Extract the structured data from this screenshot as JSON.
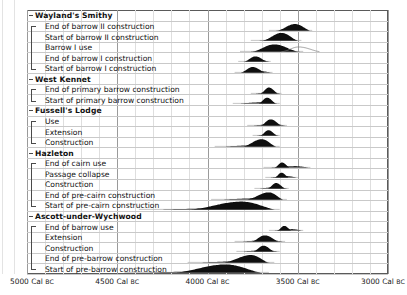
{
  "chart_data": {
    "type": "bar",
    "subtype": "radiocarbon-probability-distributions",
    "title": "",
    "xlabel": "Cal BC",
    "ylabel": "",
    "xlim": [
      5000,
      3000
    ],
    "x_direction": "decreasing",
    "grid": true,
    "legend": "none",
    "axis": {
      "ticks": [
        5000,
        4500,
        4000,
        3500,
        3000
      ],
      "tick_labels": [
        "5000 Cal BC",
        "4500 Cal BC",
        "4000 Cal BC",
        "3500 Cal BC",
        "3000 Cal BC"
      ],
      "minor_tick_interval": 100,
      "unit_prefix": "",
      "unit_suffix": "Cal BC"
    },
    "groups": [
      {
        "name": "Wayland's Smithy",
        "items": [
          {
            "label": "End of barrow II construction",
            "style": "filled",
            "peak": 3510,
            "start": 3620,
            "end": 3430,
            "mode_rel": 0.55,
            "height": 0.78,
            "tail_left": 3660,
            "tail_right": 3420
          },
          {
            "label": "Start of barrow II construction",
            "style": "filled",
            "peak": 3590,
            "start": 3700,
            "end": 3500,
            "mode_rel": 0.55,
            "height": 0.92,
            "tail_left": 3760,
            "tail_right": 3480
          },
          {
            "label": "Barrow I use",
            "style": "outline-overlay",
            "peak": 3630,
            "start": 3760,
            "end": 3500,
            "mode_rel": 0.5,
            "height": 0.85,
            "tail_left": 3820,
            "tail_right": 3470
          },
          {
            "label": "End of barrow I construction",
            "style": "filled",
            "peak": 3730,
            "start": 3800,
            "end": 3670,
            "mode_rel": 0.5,
            "height": 0.62,
            "tail_left": 3830,
            "tail_right": 3650
          },
          {
            "label": "Start of barrow I construction",
            "style": "filled",
            "peak": 3745,
            "start": 3820,
            "end": 3680,
            "mode_rel": 0.5,
            "height": 0.66,
            "tail_left": 3850,
            "tail_right": 3640
          }
        ]
      },
      {
        "name": "West Kennet",
        "items": [
          {
            "label": "End of primary barrow construction",
            "style": "filled",
            "peak": 3655,
            "start": 3710,
            "end": 3610,
            "mode_rel": 0.5,
            "height": 0.72,
            "tail_left": 3760,
            "tail_right": 3590
          },
          {
            "label": "Start of primary barrow construction",
            "style": "filled",
            "peak": 3665,
            "start": 3720,
            "end": 3620,
            "mode_rel": 0.5,
            "height": 0.7,
            "tail_left": 3860,
            "tail_right": 3600
          }
        ]
      },
      {
        "name": "Fussell's Lodge",
        "items": [
          {
            "label": "Use",
            "style": "filled",
            "peak": 3645,
            "start": 3710,
            "end": 3590,
            "mode_rel": 0.5,
            "height": 0.74,
            "tail_left": 3780,
            "tail_right": 3560
          },
          {
            "label": "Extension",
            "style": "filled",
            "peak": 3660,
            "start": 3710,
            "end": 3615,
            "mode_rel": 0.5,
            "height": 0.64,
            "tail_left": 3750,
            "tail_right": 3600
          },
          {
            "label": "Construction",
            "style": "filled",
            "peak": 3690,
            "start": 3810,
            "end": 3620,
            "mode_rel": 0.58,
            "height": 0.88,
            "tail_left": 3960,
            "tail_right": 3600
          }
        ]
      },
      {
        "name": "Hazleton",
        "items": [
          {
            "label": "End of cairn use",
            "style": "filled",
            "peak": 3585,
            "start": 3630,
            "end": 3545,
            "mode_rel": 0.5,
            "height": 0.6,
            "tail_left": 3690,
            "tail_right": 3430
          },
          {
            "label": "Passage collapse",
            "style": "filled",
            "peak": 3590,
            "start": 3630,
            "end": 3550,
            "mode_rel": 0.5,
            "height": 0.58,
            "tail_left": 3680,
            "tail_right": 3500
          },
          {
            "label": "Construction",
            "style": "filled",
            "peak": 3615,
            "start": 3670,
            "end": 3570,
            "mode_rel": 0.5,
            "height": 0.66,
            "tail_left": 3740,
            "tail_right": 3550
          },
          {
            "label": "End of pre-cairn construction",
            "style": "filled",
            "peak": 3650,
            "start": 3790,
            "end": 3580,
            "mode_rel": 0.62,
            "height": 0.86,
            "tail_left": 3980,
            "tail_right": 3560
          },
          {
            "label": "Start of pre-cairn construction",
            "style": "filled",
            "peak": 3760,
            "start": 4120,
            "end": 3620,
            "mode_rel": 0.62,
            "height": 0.95,
            "tail_left": 4380,
            "tail_right": 3600
          }
        ]
      },
      {
        "name": "Ascott-under-Wychwood",
        "items": [
          {
            "label": "End of barrow use",
            "style": "filled",
            "peak": 3575,
            "start": 3615,
            "end": 3535,
            "mode_rel": 0.5,
            "height": 0.56,
            "tail_left": 3660,
            "tail_right": 3470
          },
          {
            "label": "Extension",
            "style": "filled",
            "peak": 3680,
            "start": 3760,
            "end": 3605,
            "mode_rel": 0.5,
            "height": 0.74,
            "tail_left": 3850,
            "tail_right": 3570
          },
          {
            "label": "Construction",
            "style": "filled",
            "peak": 3690,
            "start": 3750,
            "end": 3630,
            "mode_rel": 0.5,
            "height": 0.7,
            "tail_left": 3840,
            "tail_right": 3600
          },
          {
            "label": "End of pre-barrow construction",
            "style": "filled",
            "peak": 3740,
            "start": 3920,
            "end": 3660,
            "mode_rel": 0.62,
            "height": 0.9,
            "tail_left": 4110,
            "tail_right": 3630
          },
          {
            "label": "Start of pre-barrow construction",
            "style": "filled",
            "peak": 3880,
            "start": 4200,
            "end": 3700,
            "mode_rel": 0.6,
            "height": 0.97,
            "tail_left": 4460,
            "tail_right": 3660
          }
        ]
      }
    ]
  },
  "colors": {
    "distribution_fill": "#0f0f0f",
    "frame": "#5a5a5a",
    "grid_major": "#9a9a9a",
    "grid_minor": "#dedede",
    "row_line": "#c9c9c9",
    "text": "#111111",
    "background": "#ffffff"
  }
}
